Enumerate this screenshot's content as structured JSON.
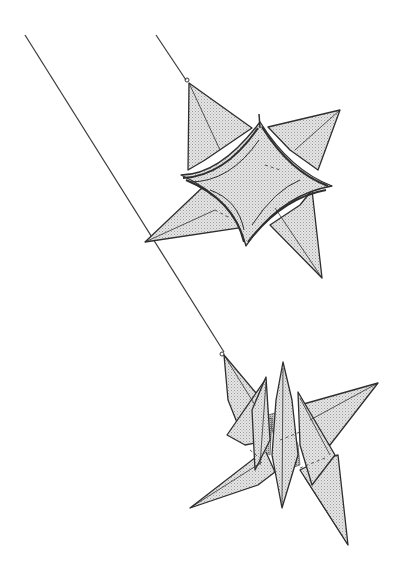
{
  "illustration": {
    "subject": "Two origami stars hanging on strings",
    "colors": {
      "background": "#ffffff",
      "ink": "#333333",
      "fill": "#d9d9d9",
      "fill_dark": "#a8a8a8"
    },
    "strings": [
      {
        "name": "long-string",
        "x1": 25,
        "y1": 35,
        "x2": 225,
        "y2": 375
      },
      {
        "name": "short-string",
        "x1": 156,
        "y1": 35,
        "x2": 188,
        "y2": 80
      }
    ],
    "upper_star": {
      "points": [
        {
          "name": "top",
          "x": 189,
          "y": 83
        },
        {
          "name": "right",
          "x": 340,
          "y": 110
        },
        {
          "name": "lower-right",
          "x": 322,
          "y": 278
        },
        {
          "name": "bottom",
          "x": 246,
          "y": 247
        },
        {
          "name": "left",
          "x": 145,
          "y": 242
        },
        {
          "name": "mid-left",
          "x": 181,
          "y": 175
        }
      ],
      "center_cusps": [
        {
          "x": 260,
          "y": 122
        },
        {
          "x": 332,
          "y": 186
        },
        {
          "x": 246,
          "y": 246
        },
        {
          "x": 182,
          "y": 175
        }
      ]
    },
    "lower_star": {
      "points": [
        {
          "name": "top-left",
          "x": 224,
          "y": 355
        },
        {
          "name": "top-center",
          "x": 283,
          "y": 362
        },
        {
          "name": "right",
          "x": 378,
          "y": 383
        },
        {
          "name": "left",
          "x": 190,
          "y": 508
        },
        {
          "name": "bottom-center",
          "x": 282,
          "y": 508
        },
        {
          "name": "bottom-right",
          "x": 348,
          "y": 545
        }
      ]
    }
  }
}
